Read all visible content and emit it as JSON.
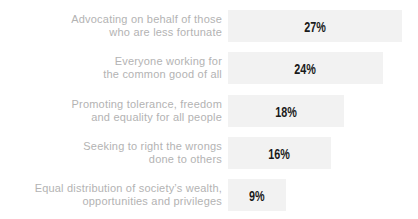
{
  "chart_data": {
    "type": "bar",
    "orientation": "horizontal",
    "title": "",
    "xlabel": "",
    "ylabel": "",
    "grid": false,
    "legend": "none",
    "value_label_position": "center-of-bar",
    "bar_color": "#f2f2f2",
    "value_color": "#1a1a1a",
    "category_color": "#b3b3b3",
    "xlim": [
      0,
      29.5
    ],
    "categories": [
      "Advocating on behalf of those who are less fortunate",
      "Everyone working for the common good of all",
      "Promoting tolerance, freedom and equality for all people",
      "Seeking to right the wrongs done to others",
      "Equal distribution of society’s wealth, opportunities and privileges"
    ],
    "category_lines": [
      [
        "Advocating on behalf of those",
        "who are less fortunate"
      ],
      [
        "Everyone working for",
        "the common good of all"
      ],
      [
        "Promoting tolerance, freedom",
        "and equality for all people"
      ],
      [
        "Seeking to right the wrongs",
        "done to others"
      ],
      [
        "Equal distribution of society’s wealth,",
        "opportunities and privileges"
      ]
    ],
    "values": [
      27,
      24,
      18,
      16,
      9
    ],
    "value_labels": [
      "27%",
      "24%",
      "18%",
      "16%",
      "9%"
    ]
  }
}
